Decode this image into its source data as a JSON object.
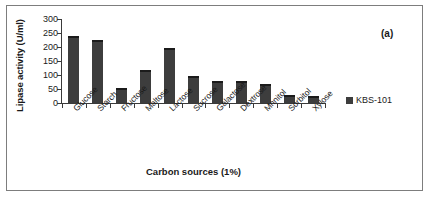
{
  "chart_data": {
    "type": "bar",
    "title": "",
    "panel_label": "(a)",
    "xlabel": "Carbon sources (1%)",
    "ylabel": "Lipase activity (U/ml)",
    "categories": [
      "Glucose",
      "Starch",
      "Fructose",
      "Maltose",
      "Lactose",
      "Sucrose",
      "Galactose",
      "Dextrose",
      "Mnnitol",
      "Sorbitol",
      "Xylose"
    ],
    "series": [
      {
        "name": "KBS-101",
        "color": "#3d3d3d",
        "values": [
          240,
          225,
          55,
          118,
          198,
          95,
          80,
          78,
          68,
          30,
          25
        ]
      }
    ],
    "ylim": [
      0,
      300
    ],
    "yticks": [
      0,
      50,
      100,
      150,
      200,
      250,
      300
    ],
    "ytick_labels": [
      "0",
      "50",
      "100",
      "150",
      "200",
      "250",
      "300"
    ],
    "grid": false,
    "legend": {
      "position": "right",
      "entries": [
        {
          "label": "KBS-101",
          "color": "#3d3d3d"
        }
      ]
    }
  }
}
